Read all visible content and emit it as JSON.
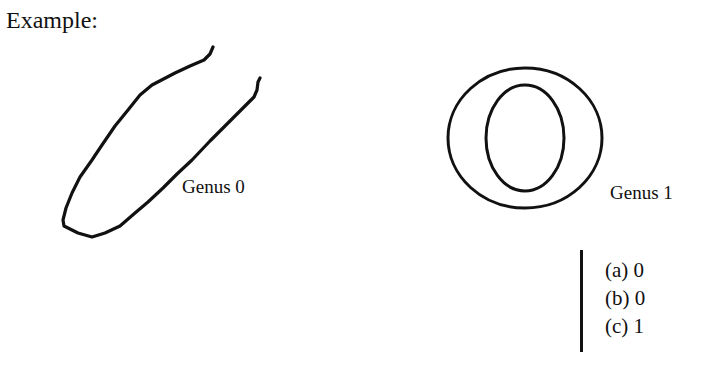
{
  "heading": "Example:",
  "figures": [
    {
      "id": "open-curve",
      "shape": "open curve (U-shaped line)",
      "label": "Genus 0"
    },
    {
      "id": "annulus",
      "shape": "two nested ellipses (ring)",
      "label": "Genus 1"
    }
  ],
  "answers": [
    {
      "key": "(a)",
      "value": "0",
      "text": "(a) 0"
    },
    {
      "key": "(b)",
      "value": "0",
      "text": "(b) 0"
    },
    {
      "key": "(c)",
      "value": "1",
      "text": "(c) 1"
    }
  ],
  "colors": {
    "ink": "#111111",
    "background": "#ffffff"
  }
}
